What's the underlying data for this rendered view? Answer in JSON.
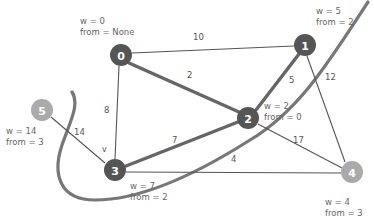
{
  "diagram": {
    "colors": {
      "node_visited": "#555555",
      "node_unvisited": "#aaaaaa",
      "edge": "#555555",
      "edge_highlight": "#666666",
      "label": "#666666",
      "background": "#ffffff"
    },
    "nodes": [
      {
        "id": "0",
        "label": "0",
        "x": 121,
        "y": 55,
        "r": 11,
        "state": "visited",
        "w": "w = 0",
        "from": "from = None",
        "annot_x": 80,
        "annot_y": 16,
        "annot_align": "left"
      },
      {
        "id": "1",
        "label": "1",
        "x": 305,
        "y": 45,
        "r": 11,
        "state": "visited",
        "w": "w = 5",
        "from": "from = 2",
        "annot_x": 316,
        "annot_y": 6,
        "annot_align": "left"
      },
      {
        "id": "2",
        "label": "2",
        "x": 248,
        "y": 118,
        "r": 11,
        "state": "visited",
        "w": "w = 2",
        "from": "from = 0",
        "annot_x": 264,
        "annot_y": 101,
        "annot_align": "left"
      },
      {
        "id": "3",
        "label": "3",
        "x": 115,
        "y": 170,
        "r": 11,
        "state": "visited",
        "w": "w = 7",
        "from": "from = 2",
        "annot_x": 130,
        "annot_y": 181,
        "annot_align": "left"
      },
      {
        "id": "4",
        "label": "4",
        "x": 352,
        "y": 172,
        "r": 11,
        "state": "unvisited",
        "w": "w = 4",
        "from": "from = 3",
        "annot_x": 325,
        "annot_y": 197,
        "annot_align": "left"
      },
      {
        "id": "5",
        "label": "5",
        "x": 42,
        "y": 110,
        "r": 11,
        "state": "unvisited",
        "w": "w = 14",
        "from": "from = 3",
        "annot_x": 6,
        "annot_y": 126,
        "annot_align": "left"
      }
    ],
    "edges": [
      {
        "from": "0",
        "to": "1",
        "weight": "10",
        "style": "thin",
        "label_x": 193,
        "label_y": 33
      },
      {
        "from": "0",
        "to": "2",
        "weight": "2",
        "style": "thick",
        "label_x": 187,
        "label_y": 71
      },
      {
        "from": "0",
        "to": "3",
        "weight": "8",
        "style": "thin",
        "label_x": 104,
        "label_y": 106
      },
      {
        "from": "1",
        "to": "2",
        "weight": "5",
        "style": "thick",
        "label_x": 289,
        "label_y": 76
      },
      {
        "from": "1",
        "to": "4",
        "weight": "12",
        "style": "thin",
        "label_x": 325,
        "label_y": 73
      },
      {
        "from": "2",
        "to": "3",
        "weight": "7",
        "style": "thick",
        "label_x": 172,
        "label_y": 136
      },
      {
        "from": "2",
        "to": "4",
        "weight": "17",
        "style": "thin",
        "label_x": 293,
        "label_y": 136
      },
      {
        "from": "3",
        "to": "4",
        "weight": "4",
        "style": "thin",
        "label_x": 231,
        "label_y": 155
      },
      {
        "from": "5",
        "to": "3",
        "weight": "14",
        "style": "thin",
        "label_x": 74,
        "label_y": 128
      }
    ],
    "pointer_markers": [
      {
        "letter": "v",
        "x": 102,
        "y": 146
      }
    ],
    "curves": [
      {
        "name": "sweep-curve",
        "d": "M 368 2 C 330 60 300 110 250 140 C 195 175 140 200 95 200 C 60 200 52 175 62 145 C 70 122 80 104 72 92"
      }
    ]
  }
}
